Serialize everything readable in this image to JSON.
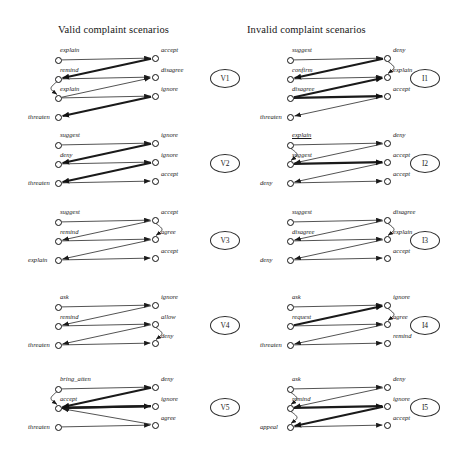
{
  "figure": {
    "columns": [
      {
        "id": "valid",
        "title": "Valid complaint scenarios"
      },
      {
        "id": "invalid",
        "title": "Invalid complaint scenarios"
      }
    ],
    "stroke_color": "#1a1a1a",
    "node_fill": "#ffffff"
  },
  "scenarios": [
    {
      "badge": "V1",
      "column": "valid",
      "left_nodes": [
        "explain",
        "remind",
        "explain",
        "threaten"
      ],
      "right_nodes": [
        "accept",
        "disagree",
        "ignore"
      ],
      "edges": [
        {
          "from": "L0",
          "to": "R0",
          "weight": "thin"
        },
        {
          "from": "R0",
          "to": "L1",
          "weight": "thick"
        },
        {
          "from": "L1",
          "to": "R1",
          "weight": "thin"
        },
        {
          "from": "L2",
          "to": "R1",
          "weight": "thin"
        },
        {
          "from": "L2",
          "to": "R2",
          "weight": "thin"
        },
        {
          "from": "R2",
          "to": "L3",
          "weight": "thick"
        },
        {
          "from": "L1",
          "to": "L2",
          "weight": "curve"
        }
      ]
    },
    {
      "badge": "V2",
      "column": "valid",
      "left_nodes": [
        "suggest",
        "deny",
        "threaten"
      ],
      "right_nodes": [
        "ignore",
        "ignore",
        "accept"
      ],
      "edges": [
        {
          "from": "L0",
          "to": "R0",
          "weight": "thin"
        },
        {
          "from": "R0",
          "to": "L1",
          "weight": "thick"
        },
        {
          "from": "L1",
          "to": "R1",
          "weight": "thin"
        },
        {
          "from": "R1",
          "to": "L2",
          "weight": "thick"
        },
        {
          "from": "L2",
          "to": "R2",
          "weight": "thin"
        }
      ]
    },
    {
      "badge": "V3",
      "column": "valid",
      "left_nodes": [
        "suggest",
        "remind",
        "explain"
      ],
      "right_nodes": [
        "accept",
        "agree",
        "accept"
      ],
      "edges": [
        {
          "from": "L0",
          "to": "R0",
          "weight": "thin"
        },
        {
          "from": "R0",
          "to": "L1",
          "weight": "thin"
        },
        {
          "from": "L1",
          "to": "R1",
          "weight": "thin"
        },
        {
          "from": "R1",
          "to": "L2",
          "weight": "thin"
        },
        {
          "from": "L2",
          "to": "R2",
          "weight": "thin"
        },
        {
          "from": "R0",
          "to": "R1",
          "weight": "curve"
        }
      ]
    },
    {
      "badge": "V4",
      "column": "valid",
      "left_nodes": [
        "ask",
        "remind",
        "threaten"
      ],
      "right_nodes": [
        "ignore",
        "allow",
        "deny"
      ],
      "edges": [
        {
          "from": "L0",
          "to": "R0",
          "weight": "thin"
        },
        {
          "from": "R0",
          "to": "L1",
          "weight": "thin"
        },
        {
          "from": "L1",
          "to": "R1",
          "weight": "thin"
        },
        {
          "from": "R1",
          "to": "L2",
          "weight": "thin"
        },
        {
          "from": "L2",
          "to": "R2",
          "weight": "thin"
        },
        {
          "from": "R1",
          "to": "R2",
          "weight": "curve"
        }
      ]
    },
    {
      "badge": "V5",
      "column": "valid",
      "left_nodes": [
        "bring_atten",
        "accept",
        "threaten"
      ],
      "right_nodes": [
        "deny",
        "ignore",
        "agree"
      ],
      "edges": [
        {
          "from": "L0",
          "to": "R0",
          "weight": "thin"
        },
        {
          "from": "R0",
          "to": "L1",
          "weight": "thick"
        },
        {
          "from": "L1",
          "to": "R1",
          "weight": "thick"
        },
        {
          "from": "R1",
          "to": "L1",
          "weight": "thick"
        },
        {
          "from": "L2",
          "to": "R2",
          "weight": "thin"
        },
        {
          "from": "R2",
          "to": "L1",
          "weight": "thin"
        },
        {
          "from": "L0",
          "to": "L1",
          "weight": "curve"
        }
      ]
    },
    {
      "badge": "I1",
      "column": "invalid",
      "left_nodes": [
        "suggest",
        "confirm",
        "disagree",
        "threaten"
      ],
      "right_nodes": [
        "deny",
        "explain",
        "accept"
      ],
      "edges": [
        {
          "from": "L0",
          "to": "R0",
          "weight": "thin"
        },
        {
          "from": "R0",
          "to": "L1",
          "weight": "thick"
        },
        {
          "from": "L1",
          "to": "R1",
          "weight": "thin"
        },
        {
          "from": "L2",
          "to": "R1",
          "weight": "thick"
        },
        {
          "from": "L2",
          "to": "R2",
          "weight": "thick"
        },
        {
          "from": "R2",
          "to": "L3",
          "weight": "thin"
        },
        {
          "from": "R0",
          "to": "R1",
          "weight": "curve"
        }
      ]
    },
    {
      "badge": "I2",
      "column": "invalid",
      "left_nodes": [
        "explain",
        "suggest",
        "deny"
      ],
      "right_nodes": [
        "deny",
        "accept",
        "accept"
      ],
      "edges": [
        {
          "from": "L0",
          "to": "R0",
          "weight": "thin"
        },
        {
          "from": "R0",
          "to": "L1",
          "weight": "thin"
        },
        {
          "from": "L1",
          "to": "R1",
          "weight": "thick"
        },
        {
          "from": "R1",
          "to": "L2",
          "weight": "thin"
        },
        {
          "from": "L2",
          "to": "R2",
          "weight": "thin"
        },
        {
          "from": "L0",
          "to": "L1",
          "weight": "curve"
        }
      ],
      "underlined_labels": [
        "explain"
      ]
    },
    {
      "badge": "I3",
      "column": "invalid",
      "left_nodes": [
        "suggest",
        "disagree",
        "deny"
      ],
      "right_nodes": [
        "disagree",
        "explain",
        "accept"
      ],
      "edges": [
        {
          "from": "L0",
          "to": "R0",
          "weight": "thin"
        },
        {
          "from": "R0",
          "to": "L1",
          "weight": "thin"
        },
        {
          "from": "L1",
          "to": "R1",
          "weight": "thin"
        },
        {
          "from": "R1",
          "to": "L2",
          "weight": "thin"
        },
        {
          "from": "L2",
          "to": "R2",
          "weight": "thin"
        },
        {
          "from": "R0",
          "to": "R1",
          "weight": "curve"
        }
      ]
    },
    {
      "badge": "I4",
      "column": "invalid",
      "left_nodes": [
        "ask",
        "request",
        "threaten"
      ],
      "right_nodes": [
        "ignore",
        "agree",
        "remind"
      ],
      "edges": [
        {
          "from": "L0",
          "to": "R0",
          "weight": "thin"
        },
        {
          "from": "L1",
          "to": "R0",
          "weight": "thick"
        },
        {
          "from": "L1",
          "to": "R1",
          "weight": "thin"
        },
        {
          "from": "R1",
          "to": "L2",
          "weight": "thin"
        },
        {
          "from": "L2",
          "to": "R2",
          "weight": "thin"
        },
        {
          "from": "R0",
          "to": "R1",
          "weight": "curve"
        }
      ]
    },
    {
      "badge": "I5",
      "column": "invalid",
      "left_nodes": [
        "ask",
        "remind",
        "appeal"
      ],
      "right_nodes": [
        "deny",
        "ignore",
        "accept"
      ],
      "edges": [
        {
          "from": "L0",
          "to": "R0",
          "weight": "thin"
        },
        {
          "from": "R0",
          "to": "L1",
          "weight": "thin"
        },
        {
          "from": "L1",
          "to": "R1",
          "weight": "thick"
        },
        {
          "from": "R1",
          "to": "L2",
          "weight": "thick"
        },
        {
          "from": "L2",
          "to": "R2",
          "weight": "thin"
        },
        {
          "from": "L0",
          "to": "L1",
          "weight": "curve"
        },
        {
          "from": "L1",
          "to": "L2",
          "weight": "curve"
        }
      ]
    }
  ],
  "geometry": {
    "block_tops": [
      52,
      137,
      214,
      299,
      381
    ],
    "row_gap": 19,
    "valid_left_x": 58,
    "valid_right_x": 155,
    "invalid_left_x": 290,
    "invalid_right_x": 387,
    "valid_badge_x": 225,
    "invalid_badge_x": 425
  }
}
